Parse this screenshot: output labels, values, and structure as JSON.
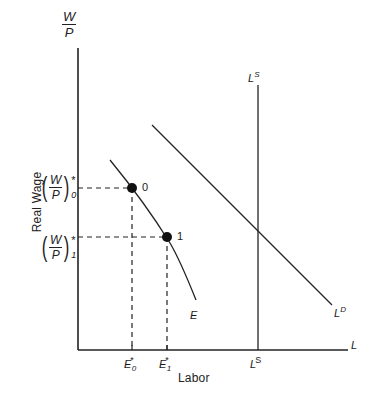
{
  "figure": {
    "title_visible": false,
    "background": "#ffffff",
    "ink": "#222222"
  },
  "axes": {
    "y_axis_label_numerator": "W",
    "y_axis_label_denominator": "P",
    "y_axis_name": "Real Wage",
    "x_axis_name": "Labor",
    "x_axis_end_label": "L",
    "origin_px": [
      78,
      350
    ],
    "x_axis_end_px": [
      348,
      350
    ],
    "y_axis_top_px": [
      78,
      48
    ]
  },
  "y_ticks": [
    {
      "id": "wp0",
      "open_paren": "(",
      "numerator": "W",
      "denominator": "P",
      "close_paren": ")",
      "superscript": "*",
      "subscript": "0",
      "y_px": 188
    },
    {
      "id": "wp1",
      "open_paren": "(",
      "numerator": "W",
      "denominator": "P",
      "close_paren": ")",
      "superscript": "*",
      "subscript": "1",
      "y_px": 237
    }
  ],
  "x_ticks": [
    {
      "id": "e0",
      "base": "E",
      "superscript": "*",
      "subscript": "0",
      "x_px": 132
    },
    {
      "id": "e1",
      "base": "E",
      "superscript": "*",
      "subscript": "1",
      "x_px": 167
    },
    {
      "id": "ls",
      "base": "L",
      "superscript": "S",
      "subscript": "",
      "x_px": 258
    }
  ],
  "curves": {
    "employment_curve": {
      "label": "E",
      "kind": "convex-decreasing",
      "path_px": "M 110,160 C 128,182 152,214 170,243 C 180,260 188,280 196,300"
    },
    "labor_demand": {
      "label": "L",
      "label_superscript": "D",
      "kind": "straight-decreasing",
      "start_px": [
        152,
        125
      ],
      "end_px": [
        332,
        305
      ]
    },
    "labor_supply": {
      "label": "L",
      "label_superscript": "S",
      "kind": "vertical",
      "x_px": 258,
      "top_px": 85,
      "bottom_px": 350
    }
  },
  "points": [
    {
      "label": "0",
      "x_px": 132,
      "y_px": 188,
      "filled": true
    },
    {
      "label": "1",
      "x_px": 167,
      "y_px": 237,
      "filled": true
    }
  ],
  "guide_lines": [
    {
      "from_px": [
        78,
        188
      ],
      "to_px": [
        132,
        188
      ],
      "style": "dashed",
      "orientation": "horizontal"
    },
    {
      "from_px": [
        78,
        237
      ],
      "to_px": [
        167,
        237
      ],
      "style": "dashed",
      "orientation": "horizontal"
    },
    {
      "from_px": [
        132,
        188
      ],
      "to_px": [
        132,
        350
      ],
      "style": "dashed",
      "orientation": "vertical"
    },
    {
      "from_px": [
        167,
        237
      ],
      "to_px": [
        167,
        350
      ],
      "style": "dashed",
      "orientation": "vertical"
    }
  ]
}
